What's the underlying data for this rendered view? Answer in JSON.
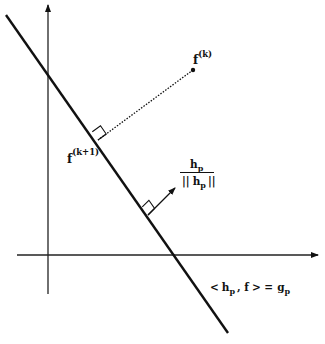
{
  "diagram": {
    "type": "geometric-projection",
    "axes": {
      "x_axis": {
        "from": [
          17,
          255
        ],
        "to": [
          318,
          255
        ],
        "arrow": true
      },
      "y_axis": {
        "from": [
          48,
          294
        ],
        "to": [
          48,
          5
        ],
        "arrow": true
      }
    },
    "hyperplane_line": {
      "from": [
        6,
        15
      ],
      "to": [
        228,
        333
      ]
    },
    "projection": {
      "point_fk": [
        193,
        70
      ],
      "foot_fk1": [
        98,
        140
      ],
      "style": "dotted"
    },
    "normal_vector": {
      "from": [
        148,
        215
      ],
      "to": [
        175,
        188
      ]
    },
    "labels": {
      "fk_base": "f",
      "fk_sup": "(k)",
      "fk1_base": "f",
      "fk1_sup": "(k+1)",
      "normal_num_base": "h",
      "normal_num_sub": "p",
      "normal_den_left": "||",
      "normal_den_base": "h",
      "normal_den_sub": "p",
      "normal_den_right": "||",
      "eq_lt": "<",
      "eq_h": "h",
      "eq_h_sub": "p",
      "eq_comma_f": ", f",
      "eq_gt_eq": "> =",
      "eq_g": "g",
      "eq_g_sub": "p"
    },
    "colors": {
      "line": "#111111",
      "background": "#ffffff"
    }
  }
}
